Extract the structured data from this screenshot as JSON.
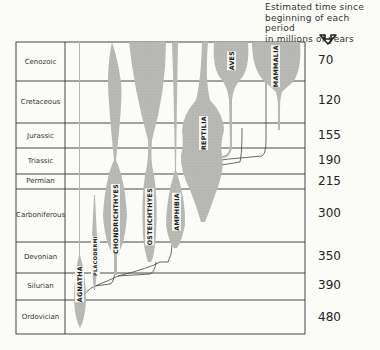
{
  "caption": {
    "lines": [
      "Estimated time since",
      "beginning of each period",
      "in millions of years"
    ],
    "arrow_icon": "down-arrow-icon"
  },
  "periods": [
    {
      "name": "Cenozoic",
      "age_mya": "70"
    },
    {
      "name": "Cretaceous",
      "age_mya": "120"
    },
    {
      "name": "Jurassic",
      "age_mya": "155"
    },
    {
      "name": "Triassic",
      "age_mya": "190"
    },
    {
      "name": "Permian",
      "age_mya": "215"
    },
    {
      "name": "Carboniferous",
      "age_mya": "300"
    },
    {
      "name": "Devonian",
      "age_mya": "350"
    },
    {
      "name": "Silurian",
      "age_mya": "390"
    },
    {
      "name": "Ordovician",
      "age_mya": "480"
    }
  ],
  "taxa": [
    {
      "name": "AGNATHA"
    },
    {
      "name": "PLACODERMI"
    },
    {
      "name": "CHONDRICHTHYES"
    },
    {
      "name": "OSTEICHTHYES"
    },
    {
      "name": "AMPHIBIA"
    },
    {
      "name": "REPTILIA"
    },
    {
      "name": "AVES"
    },
    {
      "name": "MAMMALIA"
    }
  ],
  "colors": {
    "spindle_fill": "#b9b9b5",
    "grid_line": "#333333",
    "background": "#fbfbf8"
  }
}
